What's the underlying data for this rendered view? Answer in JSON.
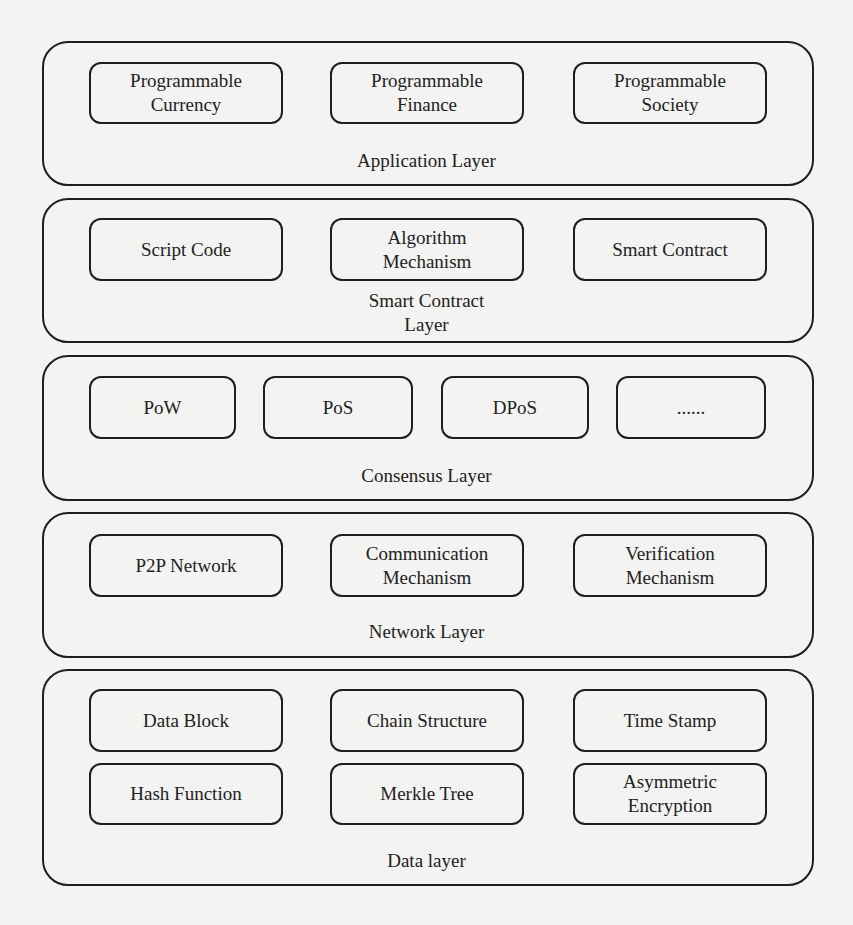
{
  "diagram": {
    "type": "layered-architecture",
    "layers": [
      {
        "label": "Application Layer",
        "components": [
          "Programmable\nCurrency",
          "Programmable\nFinance",
          "Programmable\nSociety"
        ]
      },
      {
        "label": "Smart Contract\nLayer",
        "components": [
          "Script Code",
          "Algorithm\nMechanism",
          "Smart Contract"
        ]
      },
      {
        "label": "Consensus Layer",
        "components": [
          "PoW",
          "PoS",
          "DPoS",
          "......"
        ]
      },
      {
        "label": "Network Layer",
        "components": [
          "P2P Network",
          "Communication\nMechanism",
          "Verification\nMechanism"
        ]
      },
      {
        "label": "Data layer",
        "components": [
          "Data Block",
          "Chain Structure",
          "Time Stamp",
          "Hash Function",
          "Merkle Tree",
          "Asymmetric\nEncryption"
        ]
      }
    ]
  }
}
